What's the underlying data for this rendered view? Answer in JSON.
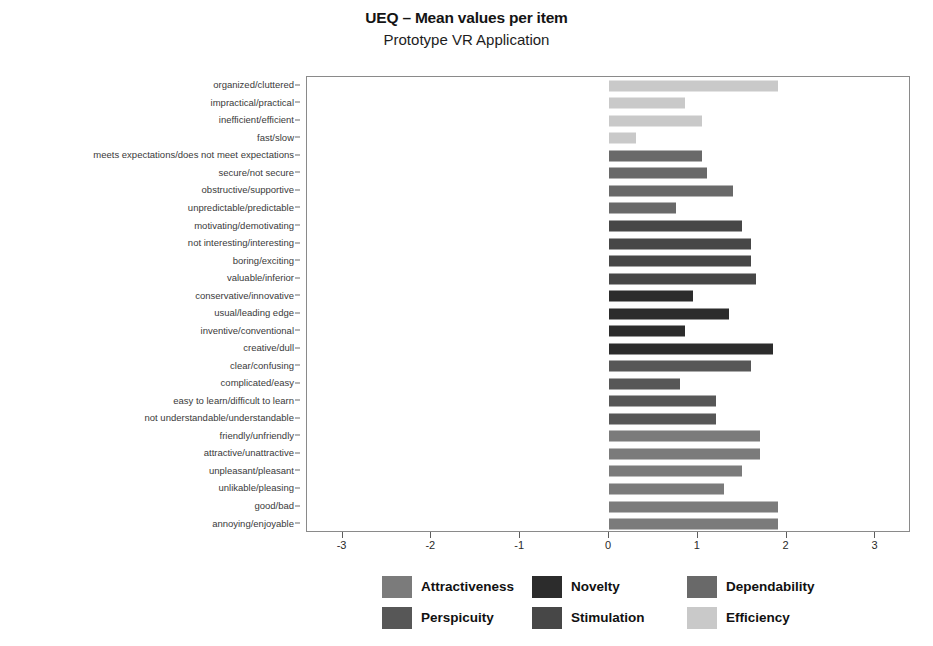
{
  "chart_data": {
    "type": "bar",
    "orientation": "horizontal",
    "title": "UEQ – Mean values per item",
    "subtitle": "Prototype VR Application",
    "xlabel": "",
    "ylabel": "",
    "xlim": [
      -3.4,
      3.4
    ],
    "xticks": [
      -3,
      -2,
      -1,
      0,
      1,
      2,
      3
    ],
    "xtick_labels": [
      "-3",
      "-2",
      "-1",
      "0",
      "1",
      "2",
      "3"
    ],
    "grid": false,
    "legend_position": "bottom",
    "legend": [
      {
        "name": "Attractiveness",
        "color": "#7b7b7b"
      },
      {
        "name": "Perspicuity",
        "color": "#575757"
      },
      {
        "name": "Novelty",
        "color": "#2c2c2c"
      },
      {
        "name": "Stimulation",
        "color": "#474747"
      },
      {
        "name": "Dependability",
        "color": "#696969"
      },
      {
        "name": "Efficiency",
        "color": "#c9c9c9"
      }
    ],
    "categories": [
      "organized/cluttered",
      "impractical/practical",
      "inefficient/efficient",
      "fast/slow",
      "meets expectations/does not meet expectations",
      "secure/not secure",
      "obstructive/supportive",
      "unpredictable/predictable",
      "motivating/demotivating",
      "not interesting/interesting",
      "boring/exciting",
      "valuable/inferior",
      "conservative/innovative",
      "usual/leading edge",
      "inventive/conventional",
      "creative/dull",
      "clear/confusing",
      "complicated/easy",
      "easy to learn/difficult to learn",
      "not understandable/understandable",
      "friendly/unfriendly",
      "attractive/unattractive",
      "unpleasant/pleasant",
      "unlikable/pleasing",
      "good/bad",
      "annoying/enjoyable"
    ],
    "values": [
      1.9,
      0.85,
      1.05,
      0.3,
      1.05,
      1.1,
      1.4,
      0.75,
      1.5,
      1.6,
      1.6,
      1.65,
      0.95,
      1.35,
      0.85,
      1.85,
      1.6,
      0.8,
      1.2,
      1.2,
      1.7,
      1.7,
      1.5,
      1.3,
      1.9,
      1.9
    ],
    "scales": [
      "Efficiency",
      "Efficiency",
      "Efficiency",
      "Efficiency",
      "Dependability",
      "Dependability",
      "Dependability",
      "Dependability",
      "Stimulation",
      "Stimulation",
      "Stimulation",
      "Stimulation",
      "Novelty",
      "Novelty",
      "Novelty",
      "Novelty",
      "Perspicuity",
      "Perspicuity",
      "Perspicuity",
      "Perspicuity",
      "Attractiveness",
      "Attractiveness",
      "Attractiveness",
      "Attractiveness",
      "Attractiveness",
      "Attractiveness"
    ]
  }
}
